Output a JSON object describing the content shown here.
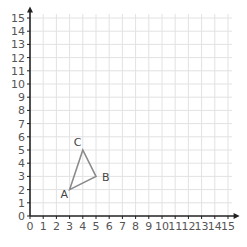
{
  "chart_data": {
    "type": "scatter",
    "title": "",
    "xlabel": "",
    "ylabel": "",
    "xlim": [
      0,
      15
    ],
    "ylim": [
      0,
      15
    ],
    "grid": true,
    "x_ticks": [
      "0",
      "1",
      "2",
      "3",
      "4",
      "5",
      "6",
      "7",
      "8",
      "9",
      "10",
      "11",
      "12",
      "13",
      "14",
      "15"
    ],
    "y_ticks": [
      "0",
      "1",
      "2",
      "3",
      "4",
      "5",
      "6",
      "7",
      "8",
      "9",
      "10",
      "11",
      "12",
      "13",
      "14",
      "15"
    ],
    "shape": "triangle",
    "points": [
      {
        "label": "A",
        "x": 3,
        "y": 2
      },
      {
        "label": "B",
        "x": 5,
        "y": 3
      },
      {
        "label": "C",
        "x": 4,
        "y": 5
      }
    ]
  },
  "colors": {
    "grid": "#e2e2e2",
    "axis": "#222222",
    "triangle": "#8a8a8a",
    "label": "#555555"
  }
}
